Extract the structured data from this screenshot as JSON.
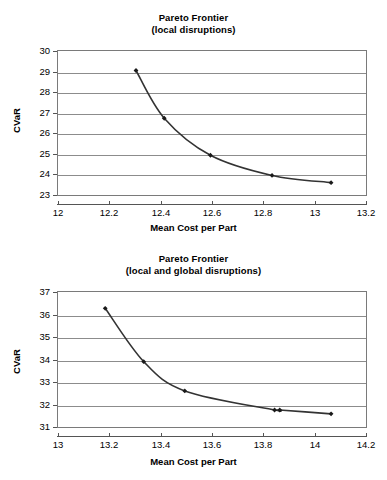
{
  "chart_data": [
    {
      "type": "line",
      "title": "Pareto Frontier (local disruptions)",
      "title_line1": "Pareto Frontier",
      "title_line2": "(local disruptions)",
      "xlabel": "Mean Cost per Part",
      "ylabel": "CVaR",
      "xlim": [
        12,
        13.2
      ],
      "ylim": [
        23,
        30
      ],
      "xticks": [
        12,
        12.2,
        12.4,
        12.6,
        12.8,
        13,
        13.2
      ],
      "xtick_labels": [
        "12",
        "12.2",
        "12.4",
        "12.6",
        "12.8",
        "13",
        "13.2"
      ],
      "yticks": [
        23,
        24,
        25,
        26,
        27,
        28,
        29,
        30
      ],
      "ytick_labels": [
        "23",
        "24",
        "25",
        "26",
        "27",
        "28",
        "29",
        "30"
      ],
      "grid": "horizontal",
      "legend": "none",
      "marker": "diamond",
      "line_color": "#333333",
      "marker_color": "#1a1a1a",
      "x": [
        12.3,
        12.41,
        12.59,
        12.83,
        13.06
      ],
      "y": [
        29.1,
        26.78,
        24.98,
        24.0,
        23.65
      ]
    },
    {
      "type": "line",
      "title": "Pareto Frontier (local and global disruptions)",
      "title_line1": "Pareto Frontier",
      "title_line2": "(local and global disruptions)",
      "xlabel": "Mean Cost per Part",
      "ylabel": "CVaR",
      "xlim": [
        13,
        14.2
      ],
      "ylim": [
        31,
        37
      ],
      "xticks": [
        13,
        13.2,
        13.4,
        13.6,
        13.8,
        14,
        14.2
      ],
      "xtick_labels": [
        "13",
        "13.2",
        "13.4",
        "13.6",
        "13.8",
        "14",
        "14.2"
      ],
      "yticks": [
        31,
        32,
        33,
        34,
        35,
        36,
        37
      ],
      "ytick_labels": [
        "31",
        "32",
        "33",
        "34",
        "35",
        "36",
        "37"
      ],
      "grid": "horizontal",
      "legend": "none",
      "marker": "diamond",
      "line_color": "#333333",
      "marker_color": "#1a1a1a",
      "x": [
        13.18,
        13.33,
        13.49,
        13.84,
        13.86,
        14.06
      ],
      "y": [
        36.32,
        33.95,
        32.65,
        31.8,
        31.8,
        31.63
      ]
    }
  ],
  "colors": {
    "plot_border": "#7a7a7a",
    "gridline": "#8c8c8c",
    "series_line": "#333333",
    "text": "#000000",
    "background": "#ffffff"
  }
}
